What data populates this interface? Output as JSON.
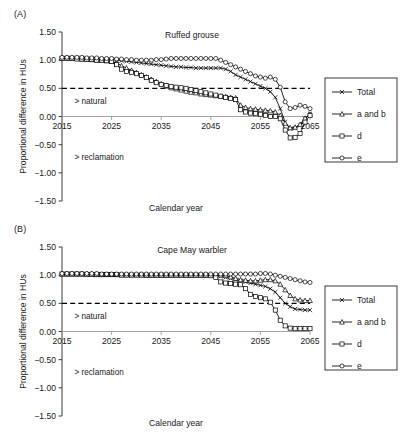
{
  "figure": {
    "xlabel": "Calendar year",
    "ylabel": "Proportional difference in HUs",
    "threshold_value": 0.5,
    "annotation_above": "> natural",
    "annotation_below": "> reclamation",
    "ytick_labels": [
      "1.50",
      "1.00",
      "0.50",
      "0.00",
      "−0.50",
      "−1.00",
      "−1.50"
    ],
    "ytick_values": [
      1.5,
      1.0,
      0.5,
      0.0,
      -0.5,
      -1.0,
      -1.5
    ],
    "xtick_labels": [
      "2015",
      "2025",
      "2035",
      "2045",
      "2055",
      "2065"
    ],
    "xtick_values": [
      2015,
      2025,
      2035,
      2045,
      2055,
      2065
    ],
    "legend": {
      "items": [
        {
          "label": "Total",
          "marker": "x-icon"
        },
        {
          "label": "a and b",
          "marker": "triangle-icon"
        },
        {
          "label": "d",
          "marker": "square-icon"
        },
        {
          "label": "e",
          "marker": "circle-icon"
        }
      ]
    }
  },
  "panels": [
    {
      "id": "A",
      "panel_label": "(A)",
      "title": "Ruffed grouse",
      "chart_data": {
        "type": "line",
        "title": "Ruffed grouse",
        "xlabel": "Calendar year",
        "ylabel": "Proportional difference in HUs",
        "xlim": [
          2015,
          2065
        ],
        "ylim": [
          -1.5,
          1.5
        ],
        "grid": false,
        "legend_position": "right-outside",
        "annotations": [
          {
            "text": "> natural",
            "x": 2018,
            "y": 0.2
          },
          {
            "text": "> reclamation",
            "x": 2018,
            "y": -0.78
          },
          {
            "text": "threshold",
            "y": 0.5,
            "style": "dashed"
          }
        ],
        "x": [
          2015,
          2016,
          2017,
          2018,
          2019,
          2020,
          2021,
          2022,
          2023,
          2024,
          2025,
          2026,
          2027,
          2028,
          2029,
          2030,
          2031,
          2032,
          2033,
          2034,
          2035,
          2036,
          2037,
          2038,
          2039,
          2040,
          2041,
          2042,
          2043,
          2044,
          2045,
          2046,
          2047,
          2048,
          2049,
          2050,
          2051,
          2052,
          2053,
          2054,
          2055,
          2056,
          2057,
          2058,
          2059,
          2060,
          2061,
          2062,
          2063,
          2064,
          2065
        ],
        "series": [
          {
            "name": "Total",
            "marker": "x-icon",
            "values": [
              1.04,
              1.04,
              1.04,
              1.04,
              1.04,
              1.03,
              1.03,
              1.02,
              1.02,
              1.01,
              1.01,
              1.0,
              0.99,
              0.98,
              0.97,
              0.96,
              0.95,
              0.94,
              0.93,
              0.92,
              0.91,
              0.9,
              0.89,
              0.88,
              0.88,
              0.87,
              0.87,
              0.86,
              0.86,
              0.86,
              0.86,
              0.86,
              0.86,
              0.84,
              0.8,
              0.74,
              0.7,
              0.66,
              0.62,
              0.58,
              0.54,
              0.5,
              0.44,
              0.34,
              0.14,
              -0.1,
              -0.22,
              -0.21,
              -0.16,
              -0.04,
              0.05
            ]
          },
          {
            "name": "a and b",
            "marker": "triangle-icon",
            "values": [
              1.04,
              1.04,
              1.03,
              1.03,
              1.02,
              1.02,
              1.01,
              1.0,
              1.0,
              0.99,
              0.98,
              0.95,
              0.9,
              0.86,
              0.82,
              0.78,
              0.74,
              0.7,
              0.66,
              0.62,
              0.58,
              0.54,
              0.51,
              0.49,
              0.47,
              0.45,
              0.43,
              0.42,
              0.4,
              0.39,
              0.38,
              0.37,
              0.36,
              0.35,
              0.34,
              0.33,
              0.2,
              0.16,
              0.14,
              0.13,
              0.12,
              0.11,
              0.1,
              0.08,
              0.02,
              -0.12,
              -0.2,
              -0.19,
              -0.14,
              -0.03,
              0.04
            ]
          },
          {
            "name": "d",
            "marker": "square-icon",
            "values": [
              1.03,
              1.03,
              1.03,
              1.02,
              1.02,
              1.01,
              1.01,
              1.0,
              1.0,
              0.99,
              0.98,
              0.92,
              0.84,
              0.8,
              0.78,
              0.76,
              0.73,
              0.69,
              0.64,
              0.6,
              0.57,
              0.55,
              0.53,
              0.52,
              0.51,
              0.5,
              0.48,
              0.46,
              0.44,
              0.42,
              0.4,
              0.38,
              0.36,
              0.34,
              0.32,
              0.3,
              0.12,
              0.08,
              0.06,
              0.05,
              0.04,
              0.02,
              0.0,
              0.0,
              -0.04,
              -0.24,
              -0.38,
              -0.37,
              -0.3,
              -0.1,
              0.02
            ]
          },
          {
            "name": "e",
            "marker": "circle-icon",
            "values": [
              1.05,
              1.05,
              1.05,
              1.05,
              1.05,
              1.04,
              1.04,
              1.04,
              1.03,
              1.03,
              1.03,
              1.02,
              1.02,
              1.01,
              1.01,
              1.0,
              1.0,
              1.0,
              1.0,
              1.01,
              1.01,
              1.02,
              1.03,
              1.03,
              1.03,
              1.03,
              1.03,
              1.03,
              1.03,
              1.03,
              1.03,
              1.03,
              1.0,
              0.96,
              0.92,
              0.88,
              0.84,
              0.8,
              0.76,
              0.72,
              0.7,
              0.68,
              0.7,
              0.66,
              0.52,
              0.26,
              0.14,
              0.16,
              0.2,
              0.18,
              0.14
            ]
          }
        ]
      }
    },
    {
      "id": "B",
      "panel_label": "(B)",
      "title": "Cape May warbler",
      "chart_data": {
        "type": "line",
        "title": "Cape May warbler",
        "xlabel": "Calendar year",
        "ylabel": "Proportional difference in HUs",
        "xlim": [
          2015,
          2065
        ],
        "ylim": [
          -1.5,
          1.5
        ],
        "grid": false,
        "legend_position": "right-outside",
        "annotations": [
          {
            "text": "> natural",
            "x": 2018,
            "y": 0.2
          },
          {
            "text": "> reclamation",
            "x": 2018,
            "y": -0.78
          },
          {
            "text": "threshold",
            "y": 0.5,
            "style": "dashed"
          }
        ],
        "x": [
          2015,
          2016,
          2017,
          2018,
          2019,
          2020,
          2021,
          2022,
          2023,
          2024,
          2025,
          2026,
          2027,
          2028,
          2029,
          2030,
          2031,
          2032,
          2033,
          2034,
          2035,
          2036,
          2037,
          2038,
          2039,
          2040,
          2041,
          2042,
          2043,
          2044,
          2045,
          2046,
          2047,
          2048,
          2049,
          2050,
          2051,
          2052,
          2053,
          2054,
          2055,
          2056,
          2057,
          2058,
          2059,
          2060,
          2061,
          2062,
          2063,
          2064,
          2065
        ],
        "series": [
          {
            "name": "Total",
            "marker": "x-icon",
            "values": [
              1.02,
              1.02,
              1.02,
              1.02,
              1.02,
              1.02,
              1.01,
              1.01,
              1.01,
              1.01,
              1.01,
              1.01,
              1.01,
              1.0,
              1.0,
              1.0,
              1.0,
              1.0,
              1.0,
              1.0,
              1.0,
              1.0,
              1.0,
              1.0,
              1.0,
              1.0,
              1.0,
              1.0,
              1.0,
              1.0,
              1.0,
              0.99,
              0.98,
              0.96,
              0.94,
              0.92,
              0.9,
              0.88,
              0.86,
              0.84,
              0.82,
              0.8,
              0.76,
              0.7,
              0.6,
              0.5,
              0.44,
              0.4,
              0.39,
              0.38,
              0.38
            ]
          },
          {
            "name": "a and b",
            "marker": "triangle-icon",
            "values": [
              1.02,
              1.02,
              1.02,
              1.02,
              1.02,
              1.02,
              1.02,
              1.01,
              1.01,
              1.01,
              1.01,
              1.01,
              1.01,
              1.01,
              1.01,
              1.01,
              1.01,
              1.0,
              1.0,
              1.0,
              1.0,
              1.0,
              1.0,
              1.0,
              1.0,
              1.0,
              1.0,
              1.0,
              1.0,
              1.0,
              1.0,
              1.0,
              1.0,
              0.99,
              0.97,
              0.94,
              0.92,
              0.91,
              0.9,
              0.9,
              0.91,
              0.92,
              0.92,
              0.9,
              0.84,
              0.74,
              0.64,
              0.58,
              0.56,
              0.55,
              0.55
            ]
          },
          {
            "name": "d",
            "marker": "square-icon",
            "values": [
              1.02,
              1.02,
              1.02,
              1.02,
              1.02,
              1.01,
              1.01,
              1.01,
              1.01,
              1.01,
              1.01,
              1.01,
              1.0,
              1.0,
              1.0,
              1.0,
              1.0,
              1.0,
              1.0,
              1.0,
              1.0,
              1.0,
              1.0,
              1.0,
              1.0,
              1.0,
              1.0,
              1.0,
              1.0,
              1.0,
              0.99,
              0.96,
              0.88,
              0.86,
              0.85,
              0.84,
              0.83,
              0.76,
              0.66,
              0.62,
              0.6,
              0.58,
              0.52,
              0.38,
              0.2,
              0.1,
              0.06,
              0.05,
              0.05,
              0.05,
              0.05
            ]
          },
          {
            "name": "e",
            "marker": "circle-icon",
            "values": [
              1.03,
              1.03,
              1.03,
              1.03,
              1.03,
              1.03,
              1.03,
              1.03,
              1.02,
              1.02,
              1.02,
              1.02,
              1.02,
              1.02,
              1.02,
              1.02,
              1.02,
              1.02,
              1.02,
              1.02,
              1.02,
              1.02,
              1.02,
              1.02,
              1.02,
              1.02,
              1.02,
              1.02,
              1.02,
              1.02,
              1.02,
              1.02,
              1.02,
              1.02,
              1.02,
              1.02,
              1.02,
              1.02,
              1.02,
              1.02,
              1.03,
              1.03,
              1.02,
              1.0,
              0.98,
              0.96,
              0.94,
              0.92,
              0.9,
              0.88,
              0.87
            ]
          }
        ]
      }
    }
  ]
}
